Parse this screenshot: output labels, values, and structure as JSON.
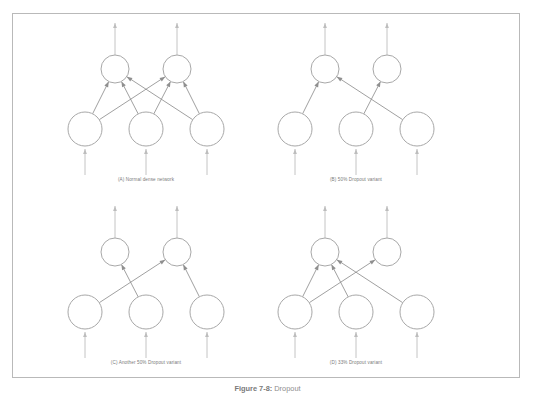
{
  "figure": {
    "caption_label": "Figure 7-8:",
    "caption_text": "Dropout",
    "border_color": "#b9b9b9",
    "neuron_stroke": "#a8a8a8",
    "edge_color": "#8f8f8f",
    "io_color": "#bdbdbd"
  },
  "panels": [
    {
      "id": "A",
      "caption": "(A) Normal dense network",
      "input_count": 3,
      "output_count": 2,
      "edges": [
        {
          "from": 0,
          "to": 0
        },
        {
          "from": 0,
          "to": 1
        },
        {
          "from": 1,
          "to": 0
        },
        {
          "from": 1,
          "to": 1
        },
        {
          "from": 2,
          "to": 0
        },
        {
          "from": 2,
          "to": 1
        }
      ]
    },
    {
      "id": "B",
      "caption": "(B) 50% Dropout variant",
      "input_count": 3,
      "output_count": 2,
      "edges": [
        {
          "from": 0,
          "to": 0
        },
        {
          "from": 1,
          "to": 1
        },
        {
          "from": 2,
          "to": 0
        }
      ]
    },
    {
      "id": "C",
      "caption": "(C) Another 50% Dropout variant",
      "input_count": 3,
      "output_count": 2,
      "edges": [
        {
          "from": 0,
          "to": 1
        },
        {
          "from": 1,
          "to": 0
        },
        {
          "from": 2,
          "to": 1
        }
      ]
    },
    {
      "id": "D",
      "caption": "(D) 33% Dropout variant",
      "input_count": 3,
      "output_count": 2,
      "edges": [
        {
          "from": 0,
          "to": 0
        },
        {
          "from": 0,
          "to": 1
        },
        {
          "from": 1,
          "to": 0
        },
        {
          "from": 2,
          "to": 0
        }
      ]
    }
  ],
  "geometry": {
    "input_radius": 17,
    "output_radius": 14,
    "input_y": 112,
    "output_y": 52,
    "input_xs": [
      34,
      95,
      156
    ],
    "output_xs": [
      64,
      126
    ],
    "input_stub_bottom": 158,
    "output_stub_top": 6
  }
}
